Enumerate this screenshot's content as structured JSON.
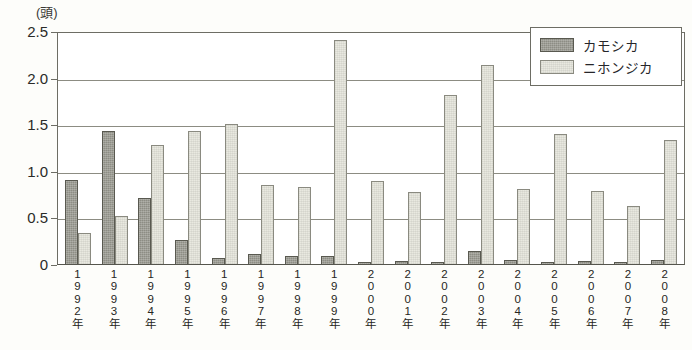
{
  "chart_data": {
    "type": "bar",
    "title": "",
    "unit_label": "(頭)",
    "xlabel": "",
    "ylabel": "",
    "ylim": [
      0,
      2.5
    ],
    "yticks": [
      "0",
      "0.5",
      "1.0",
      "1.5",
      "2.0",
      "2.5"
    ],
    "ytick_values": [
      0,
      0.5,
      1.0,
      1.5,
      2.0,
      2.5
    ],
    "grid": true,
    "legend_position": "top-right",
    "categories": [
      "1992年",
      "1993年",
      "1994年",
      "1995年",
      "1996年",
      "1997年",
      "1998年",
      "1999年",
      "2000年",
      "2001年",
      "2002年",
      "2003年",
      "2004年",
      "2005年",
      "2006年",
      "2007年",
      "2008年"
    ],
    "series": [
      {
        "name": "カモシカ",
        "color": "#8d8d84",
        "values": [
          0.9,
          1.43,
          0.71,
          0.26,
          0.06,
          0.11,
          0.09,
          0.09,
          0.02,
          0.03,
          0.02,
          0.14,
          0.04,
          0.02,
          0.03,
          0.02,
          0.04
        ]
      },
      {
        "name": "ニホンジカ",
        "color": "#e9e9e0",
        "values": [
          0.33,
          0.52,
          1.28,
          1.43,
          1.5,
          0.85,
          0.83,
          2.4,
          0.89,
          0.77,
          1.81,
          2.14,
          0.8,
          1.39,
          0.78,
          0.62,
          1.33
        ]
      }
    ]
  },
  "legend": {
    "items": [
      {
        "label": "カモシカ"
      },
      {
        "label": "ニホンジカ"
      }
    ]
  }
}
